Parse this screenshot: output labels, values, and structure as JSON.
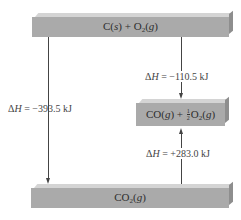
{
  "diagram": {
    "type": "enthalpy_level_diagram",
    "levels": [
      {
        "id": "top",
        "species": "C(s) + O2(g)",
        "parts": [
          "C(",
          "s",
          ") + O",
          "2",
          "(",
          "g",
          ")"
        ]
      },
      {
        "id": "middle",
        "species": "CO(g) + 1/2 O2(g)",
        "parts": [
          "CO(",
          "g",
          ") + ",
          "1",
          "2",
          "O",
          "2",
          "(",
          "g",
          ")"
        ]
      },
      {
        "id": "bottom",
        "species": "CO2(g)",
        "parts": [
          "CO",
          "2",
          "(",
          "g",
          ")"
        ]
      }
    ],
    "transitions": [
      {
        "from": "top",
        "to": "bottom",
        "delta_h": "ΔH = −393.5 kJ",
        "delta": "Δ",
        "h": "H",
        "value": " = −393.5 kJ",
        "direction": "down"
      },
      {
        "from": "top",
        "to": "middle",
        "delta_h": "ΔH = −110.5 kJ",
        "delta": "Δ",
        "h": "H",
        "value": " = −110.5 kJ",
        "direction": "down"
      },
      {
        "from": "bottom",
        "to": "middle",
        "delta_h": "ΔH = +283.0 kJ",
        "delta": "Δ",
        "h": "H",
        "value": " = +283.0 kJ",
        "direction": "up"
      }
    ]
  },
  "colors": {
    "bar_front": "#aaaaaa",
    "bar_top": "#d4d4d4",
    "bar_side": "#8e8e8e",
    "arrow": "#444444"
  }
}
